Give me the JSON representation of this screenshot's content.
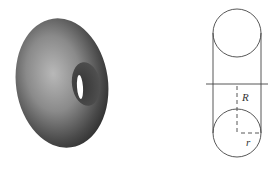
{
  "figure": {
    "left": {
      "description": "Shaded 3D torus (doughnut) viewed obliquely"
    },
    "right": {
      "description": "Cross-section of a torus showing major radius R and minor radius r",
      "labels": {
        "major_radius": "R",
        "minor_radius": "r"
      }
    }
  }
}
